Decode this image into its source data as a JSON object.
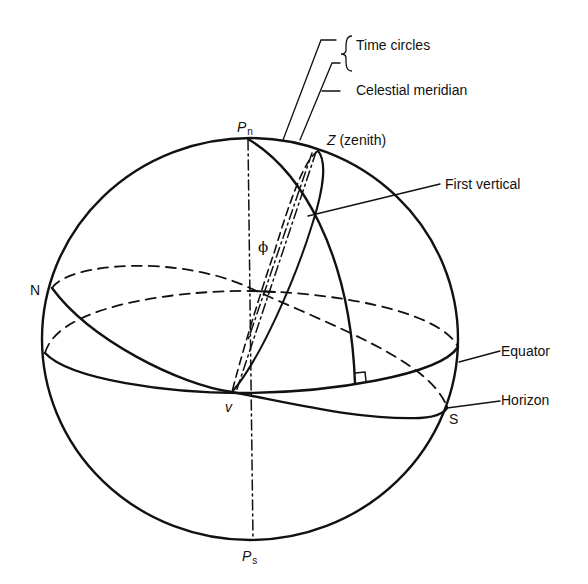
{
  "diagram": {
    "type": "celestial sphere",
    "labels": {
      "time_circles": "Time circles",
      "brace": "{",
      "celestial_meridian": "Celestial meridian",
      "north_pole": "P",
      "north_pole_sub": "n",
      "zenith_letter": "Z",
      "zenith_text": "(zenith)",
      "first_vertical": "First vertical",
      "latitude_symbol": "ϕ",
      "north_point": "N",
      "equator": "Equator",
      "horizon": "Horizon",
      "south_point": "S",
      "vernal_point": "v",
      "south_pole": "P",
      "south_pole_sub": "s"
    },
    "colors": {
      "line": "#111111",
      "background": "#ffffff"
    }
  }
}
